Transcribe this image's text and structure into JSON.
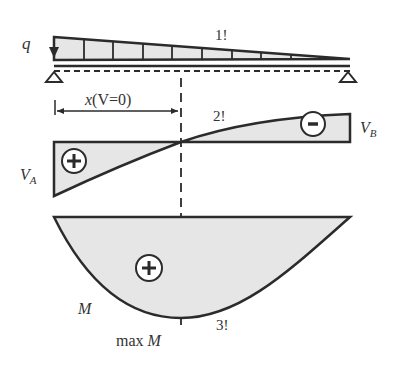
{
  "diagram": {
    "type": "beam_load_shear_moment",
    "colors": {
      "line": "#2b2b2b",
      "fill": "#e6e6e6",
      "text": "#333333"
    },
    "load": {
      "label": "q",
      "marker": "1!",
      "shape": "triangular, max at left support, zero at right support",
      "divisions": 9
    },
    "supports": {
      "left": "pinned",
      "right": "pinned"
    },
    "dimension": {
      "label_x": "x",
      "label_cond": "(V=0)"
    },
    "shear": {
      "marker": "2!",
      "left_label": "V",
      "left_sub": "A",
      "right_label": "V",
      "right_sub": "B",
      "positive_sign": "+",
      "negative_sign": "-"
    },
    "moment": {
      "label": "M",
      "marker": "3!",
      "max_label_prefix": "max ",
      "max_label_var": "M",
      "positive_sign": "+"
    }
  }
}
